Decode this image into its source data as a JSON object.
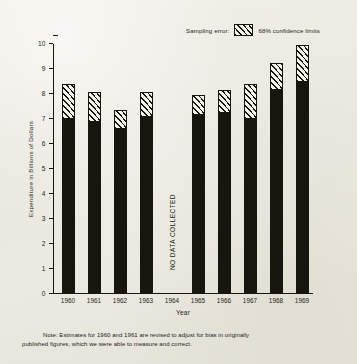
{
  "legend": {
    "label": "Sampling error:",
    "series_label": "68% confidence limits",
    "swatch_icon": "diagonal-hatch-swatch"
  },
  "axes": {
    "ylabel": "Expenditure in Billions of Dollars",
    "xlabel": "Year",
    "yticks": [
      "0",
      "1",
      "2",
      "3",
      "4",
      "5",
      "6",
      "7",
      "8",
      "9",
      "10"
    ]
  },
  "annotations": {
    "no_data": "NO DATA COLLECTED"
  },
  "footnote": {
    "line1": "Note:  Estimates for 1960 and 1961 are revised to adjust for bias in originally",
    "line2": "published figures,  which we were able to measure and correct."
  },
  "colors": {
    "paper": "#ebe9e0",
    "ink": "#16160f",
    "hatch_fill": "#f3f1e8"
  },
  "chart_data": {
    "type": "bar",
    "title": "",
    "xlabel": "Year",
    "ylabel": "Expenditure in Billions of Dollars",
    "ylim": [
      0,
      10
    ],
    "grid": false,
    "legend_position": "top-right",
    "categories": [
      "1960",
      "1961",
      "1962",
      "1963",
      "1964",
      "1965",
      "1966",
      "1967",
      "1968",
      "1969"
    ],
    "values": [
      7.45,
      7.15,
      6.85,
      7.55,
      null,
      7.45,
      7.55,
      7.45,
      8.5,
      8.9
    ],
    "error_low": [
      7.0,
      6.9,
      6.6,
      7.1,
      null,
      7.15,
      7.25,
      7.0,
      8.15,
      8.5
    ],
    "error_high": [
      8.4,
      8.1,
      7.35,
      8.1,
      null,
      7.95,
      8.15,
      8.4,
      9.25,
      9.95
    ],
    "error_type": "68% confidence limits",
    "missing_categories": [
      "1964"
    ],
    "missing_note": "NO DATA COLLECTED",
    "note": "Note:  Estimates for 1960 and 1961 are revised to adjust for bias in originally published figures,  which we were able to measure and correct."
  }
}
